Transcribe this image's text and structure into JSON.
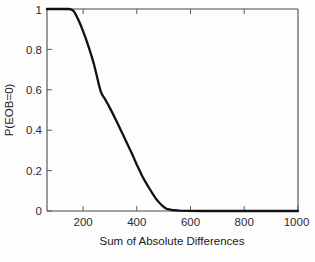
{
  "chart_data": {
    "type": "line",
    "title": "",
    "xlabel": "Sum of Absolute Differences",
    "ylabel": "P(EOB=0)",
    "xlim": [
      65,
      1000
    ],
    "ylim": [
      0,
      1
    ],
    "grid": false,
    "legend": null,
    "xticks": [
      200,
      400,
      600,
      800,
      1000
    ],
    "xticklabels": [
      "200",
      "400",
      "600",
      "800",
      "1000"
    ],
    "yticks": [
      0,
      0.2,
      0.4,
      0.6,
      0.8,
      1
    ],
    "yticklabels": [
      "0",
      "0.2",
      "0.4",
      "0.6",
      "0.8",
      "1"
    ],
    "line_color": "#111111",
    "series": [
      {
        "name": "P(EOB=0)",
        "x": [
          65,
          90,
          110,
          130,
          145,
          155,
          162,
          170,
          180,
          190,
          200,
          210,
          220,
          230,
          240,
          250,
          258,
          265,
          272,
          280,
          290,
          300,
          310,
          320,
          330,
          340,
          350,
          360,
          370,
          380,
          390,
          400,
          410,
          420,
          430,
          440,
          450,
          460,
          470,
          480,
          490,
          500,
          510,
          530,
          560,
          600,
          650,
          700,
          750,
          800,
          850,
          900,
          950,
          1000
        ],
        "y": [
          1.0,
          1.0,
          1.0,
          1.0,
          1.0,
          0.998,
          0.993,
          0.978,
          0.952,
          0.922,
          0.888,
          0.852,
          0.812,
          0.772,
          0.726,
          0.672,
          0.627,
          0.592,
          0.572,
          0.556,
          0.533,
          0.508,
          0.482,
          0.455,
          0.428,
          0.4,
          0.372,
          0.344,
          0.316,
          0.288,
          0.258,
          0.228,
          0.2,
          0.172,
          0.148,
          0.126,
          0.104,
          0.082,
          0.062,
          0.046,
          0.032,
          0.02,
          0.011,
          0.005,
          0.002,
          0.001,
          0.0,
          0.0,
          0.0,
          0.0,
          0.0,
          0.0,
          0.0,
          0.0
        ]
      }
    ]
  },
  "axes": {
    "xlabel": "Sum of Absolute Differences",
    "ylabel": "P(EOB=0)"
  }
}
